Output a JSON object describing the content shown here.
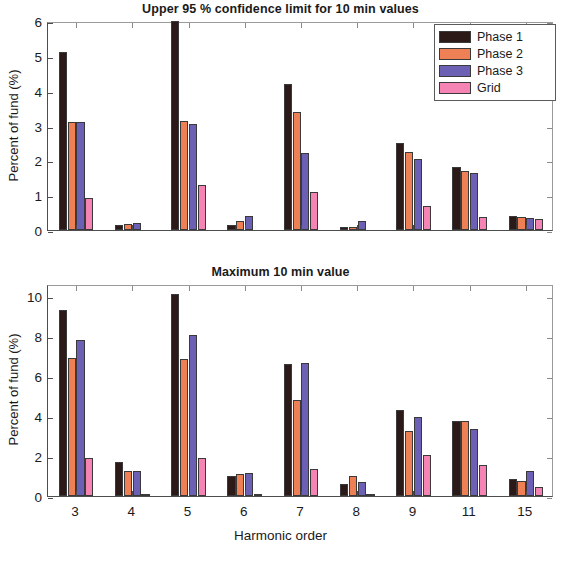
{
  "figure": {
    "xlabel": "Harmonic order",
    "legend_position": "top-right (upper panel)"
  },
  "colors": {
    "phase1": "#2c1a18",
    "phase2": "#ef8055",
    "phase3": "#6b60b4",
    "grid": "#f583b4",
    "axis": "#4d4d4d",
    "text": "#1a1a1a"
  },
  "legend": {
    "items": [
      {
        "label": "Phase 1",
        "color": "#2c1a18"
      },
      {
        "label": "Phase 2",
        "color": "#ef8055"
      },
      {
        "label": "Phase 3",
        "color": "#6b60b4"
      },
      {
        "label": "Grid",
        "color": "#f583b4"
      }
    ]
  },
  "chart_data": [
    {
      "type": "bar",
      "title": "Upper 95 % confidence limit for 10 min values",
      "xlabel": "Harmonic order",
      "ylabel": "Percent of fund (%)",
      "categories": [
        "3",
        "4",
        "5",
        "6",
        "7",
        "8",
        "9",
        "11",
        "15"
      ],
      "ylim": [
        0,
        6
      ],
      "yticks": [
        0,
        1,
        2,
        3,
        4,
        5,
        6
      ],
      "grid": false,
      "legend": [
        "Phase 1",
        "Phase 2",
        "Phase 3",
        "Grid"
      ],
      "series": [
        {
          "name": "Phase 1",
          "color": "#2c1a18",
          "values": [
            5.1,
            0.15,
            6.0,
            0.15,
            4.2,
            0.08,
            2.5,
            1.8,
            0.4
          ]
        },
        {
          "name": "Phase 2",
          "color": "#ef8055",
          "values": [
            3.1,
            0.18,
            3.12,
            0.25,
            3.4,
            0.1,
            2.25,
            1.7,
            0.38
          ]
        },
        {
          "name": "Phase 3",
          "color": "#6b60b4",
          "values": [
            3.1,
            0.2,
            3.03,
            0.4,
            2.2,
            0.25,
            2.05,
            1.65,
            0.35
          ]
        },
        {
          "name": "Grid",
          "color": "#f583b4",
          "values": [
            0.93,
            0.0,
            1.28,
            0.0,
            1.1,
            0.0,
            0.7,
            0.37,
            0.33
          ]
        }
      ]
    },
    {
      "type": "bar",
      "title": "Maximum 10 min value",
      "xlabel": "Harmonic order",
      "ylabel": "Percent of fund (%)",
      "categories": [
        "3",
        "4",
        "5",
        "6",
        "7",
        "8",
        "9",
        "11",
        "15"
      ],
      "ylim": [
        0,
        10.6
      ],
      "yticks": [
        0,
        2,
        4,
        6,
        8,
        10
      ],
      "grid": false,
      "legend": [
        "Phase 1",
        "Phase 2",
        "Phase 3",
        "Grid"
      ],
      "series": [
        {
          "name": "Phase 1",
          "color": "#2c1a18",
          "values": [
            9.3,
            1.7,
            10.1,
            1.0,
            6.6,
            0.6,
            4.3,
            3.75,
            0.85
          ]
        },
        {
          "name": "Phase 2",
          "color": "#ef8055",
          "values": [
            6.9,
            1.25,
            6.85,
            1.1,
            4.8,
            1.0,
            3.25,
            3.75,
            0.75
          ]
        },
        {
          "name": "Phase 3",
          "color": "#6b60b4",
          "values": [
            7.8,
            1.25,
            8.05,
            1.15,
            6.65,
            0.7,
            3.95,
            3.35,
            1.25
          ]
        },
        {
          "name": "Grid",
          "color": "#f583b4",
          "values": [
            1.9,
            0.12,
            1.9,
            0.12,
            1.35,
            0.1,
            2.05,
            1.55,
            0.45
          ]
        }
      ]
    }
  ]
}
